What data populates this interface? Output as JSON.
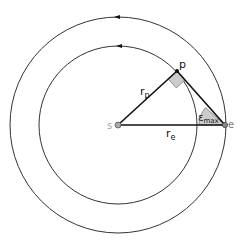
{
  "diagram": {
    "labels": {
      "s": "s",
      "p": "p",
      "e": "e",
      "r_p": "r",
      "r_p_sub": "p",
      "r_e": "r",
      "r_e_sub": "e",
      "epsilon": "ε",
      "epsilon_sub": "max"
    },
    "colors": {
      "line": "#1a1a1a",
      "orbit": "#333333",
      "fill": "#cccccc",
      "point": "#888888",
      "label_gray": "#999999"
    },
    "geometry": {
      "center": [
        118,
        125
      ],
      "inner_radius": 79,
      "outer_radius": 108,
      "point_p": [
        177,
        71
      ],
      "point_e": [
        225,
        125
      ]
    }
  }
}
